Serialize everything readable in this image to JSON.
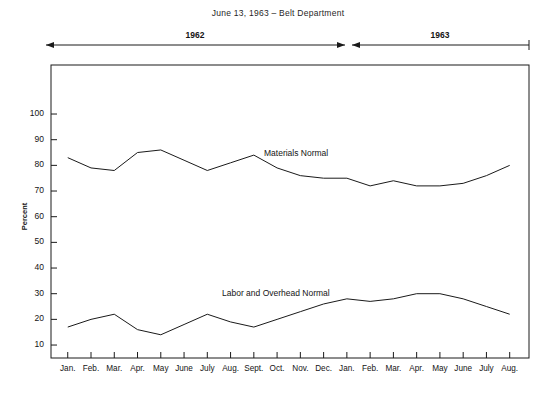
{
  "title": "June 13, 1963 – Belt Department",
  "spans": [
    {
      "label": "1962"
    },
    {
      "label": "1963"
    }
  ],
  "axes": {
    "ylabel": "Percent",
    "yticks": [
      "10",
      "20",
      "30",
      "40",
      "50",
      "60",
      "70",
      "80",
      "90",
      "100"
    ]
  },
  "series_labels": {
    "materials": "Materials Normal",
    "labor": "Labor and Overhead Normal"
  },
  "footer": "",
  "colors": {
    "line": "#1a1a1a",
    "axis": "#1a1a1a",
    "background": "#ffffff"
  },
  "chart_data": {
    "type": "line",
    "title": "June 13, 1963 – Belt Department",
    "xlabel": "",
    "ylabel": "Percent",
    "ylim": [
      0,
      105
    ],
    "grid": false,
    "legend": "inline-labels",
    "categories": [
      "Jan.",
      "Feb.",
      "Mar.",
      "Apr.",
      "May",
      "June",
      "July",
      "Aug.",
      "Sept.",
      "Oct.",
      "Nov.",
      "Dec.",
      "Jan.",
      "Feb.",
      "Mar.",
      "Apr.",
      "May",
      "June",
      "July",
      "Aug."
    ],
    "year_spans": [
      {
        "label": "1962",
        "from": "Jan.",
        "to": "Dec."
      },
      {
        "label": "1963",
        "from": "Jan.",
        "to": "Aug."
      }
    ],
    "series": [
      {
        "name": "Materials Normal",
        "values": [
          83,
          79,
          78,
          85,
          86,
          82,
          78,
          81,
          84,
          79,
          76,
          75,
          75,
          72,
          74,
          72,
          72,
          73,
          76,
          80
        ]
      },
      {
        "name": "Labor and Overhead Normal",
        "values": [
          17,
          20,
          22,
          16,
          14,
          18,
          22,
          19,
          17,
          20,
          23,
          26,
          28,
          27,
          28,
          30,
          30,
          28,
          25,
          22
        ]
      }
    ]
  }
}
